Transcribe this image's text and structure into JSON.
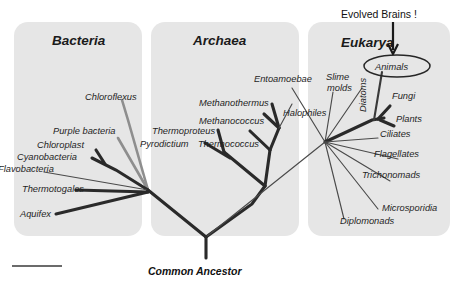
{
  "figure": {
    "title_annotation": "Evolved Brains !",
    "root_label": "Common Ancestor",
    "scale_bar": ""
  },
  "domains": [
    {
      "id": "bacteria",
      "label": "Bacteria"
    },
    {
      "id": "archaea",
      "label": "Archaea"
    },
    {
      "id": "eukarya",
      "label": "Eukarya"
    }
  ],
  "taxa": {
    "bacteria": [
      {
        "label": "Chloroflexus"
      },
      {
        "label": "Purple bacteria"
      },
      {
        "label": "Chloroplast"
      },
      {
        "label": "Cyanobacteria"
      },
      {
        "label": "Flavobacteria"
      },
      {
        "label": "Thermotogales"
      },
      {
        "label": "Aquifex"
      }
    ],
    "archaea": [
      {
        "label": "Methanothermus"
      },
      {
        "label": "Methanococcus"
      },
      {
        "label": "Halophiles"
      },
      {
        "label": "Thermoproteus"
      },
      {
        "label": "Pyrodictium"
      },
      {
        "label": "Thermococcus"
      }
    ],
    "eukarya": [
      {
        "label": "Entoamoebae"
      },
      {
        "label": "Slime"
      },
      {
        "label": "molds"
      },
      {
        "label": "Diatoms"
      },
      {
        "label": "Animals"
      },
      {
        "label": "Fungi"
      },
      {
        "label": "Plants"
      },
      {
        "label": "Ciliates"
      },
      {
        "label": "Flagellates"
      },
      {
        "label": "Trichonomads"
      },
      {
        "label": "Microsporidia"
      },
      {
        "label": "Diplomonads"
      }
    ]
  },
  "colors": {
    "panel": "#e6e6e6",
    "branch_dark": "#2a2a2a",
    "branch_gray": "#8e8e8e",
    "text": "#1a1a1a",
    "background": "#ffffff"
  }
}
